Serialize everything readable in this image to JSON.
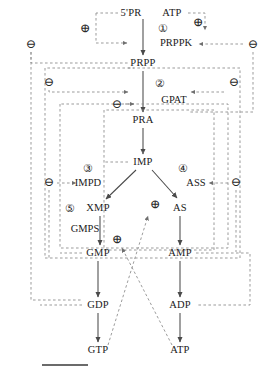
{
  "diagram": {
    "colors": {
      "reaction_arrow": "#4a4a4a",
      "regulation_line": "#8a8a8a",
      "text": "#1a1a1a",
      "background": "#ffffff"
    },
    "legend": {
      "solid_meaning": "reaction",
      "dashed_meaning": "feedback regulation",
      "plus_symbol": "⊕",
      "minus_symbol": "⊖",
      "plus_meaning": "activation",
      "minus_meaning": "inhibition"
    }
  },
  "metabolites": [
    {
      "id": "r5p",
      "label": "5'PR",
      "x": 131,
      "y": 13
    },
    {
      "id": "atp_t",
      "label": "ATP",
      "x": 172,
      "y": 13
    },
    {
      "id": "prpp",
      "label": "PRPP",
      "x": 143,
      "y": 63
    },
    {
      "id": "pra",
      "label": "PRA",
      "x": 143,
      "y": 120
    },
    {
      "id": "imp",
      "label": "IMP",
      "x": 143,
      "y": 162
    },
    {
      "id": "xmp",
      "label": "XMP",
      "x": 98,
      "y": 208
    },
    {
      "id": "as",
      "label": "AS",
      "x": 180,
      "y": 208
    },
    {
      "id": "gmp",
      "label": "GMP",
      "x": 98,
      "y": 253
    },
    {
      "id": "amp",
      "label": "AMP",
      "x": 180,
      "y": 253
    },
    {
      "id": "gdp",
      "label": "GDP",
      "x": 98,
      "y": 305
    },
    {
      "id": "adp",
      "label": "ADP",
      "x": 180,
      "y": 305
    },
    {
      "id": "gtp",
      "label": "GTP",
      "x": 98,
      "y": 350
    },
    {
      "id": "atp_b",
      "label": "ATP",
      "x": 180,
      "y": 350
    }
  ],
  "enzymes": [
    {
      "id": "prppk",
      "label": "PRPPK",
      "x": 176,
      "y": 43,
      "number": "①",
      "num_x": 163,
      "num_y": 28
    },
    {
      "id": "gpat",
      "label": "GPAT",
      "x": 174,
      "y": 100,
      "number": "②",
      "num_x": 160,
      "num_y": 83
    },
    {
      "id": "impd",
      "label": "IMPD",
      "x": 88,
      "y": 183,
      "number": "③",
      "num_x": 88,
      "num_y": 168
    },
    {
      "id": "ass",
      "label": "ASS",
      "x": 196,
      "y": 183,
      "number": "④",
      "num_x": 183,
      "num_y": 168
    },
    {
      "id": "gmps",
      "label": "GMPS",
      "x": 85,
      "y": 229,
      "number": "⑤",
      "num_x": 70,
      "num_y": 208
    }
  ],
  "regulators": [
    {
      "id": "plus-prppk-right",
      "symbol": "⊕",
      "x": 198,
      "y": 22
    },
    {
      "id": "plus-prpp-left",
      "symbol": "⊕",
      "x": 85,
      "y": 28
    },
    {
      "id": "minus-left-1",
      "symbol": "⊖",
      "x": 31,
      "y": 44
    },
    {
      "id": "minus-right-1",
      "symbol": "⊖",
      "x": 253,
      "y": 44
    },
    {
      "id": "minus-left-2",
      "symbol": "⊖",
      "x": 49,
      "y": 82
    },
    {
      "id": "minus-right-2",
      "symbol": "⊖",
      "x": 234,
      "y": 82
    },
    {
      "id": "minus-pra",
      "symbol": "⊖",
      "x": 117,
      "y": 104
    },
    {
      "id": "minus-impd",
      "symbol": "⊖",
      "x": 49,
      "y": 182
    },
    {
      "id": "minus-ass",
      "symbol": "⊖",
      "x": 236,
      "y": 182
    },
    {
      "id": "plus-as",
      "symbol": "⊕",
      "x": 155,
      "y": 204
    },
    {
      "id": "plus-gmp",
      "symbol": "⊕",
      "x": 117,
      "y": 239
    }
  ],
  "reactions": [
    {
      "from": "5'PR + ATP",
      "to": "PRPP",
      "enzyme": "PRPPK"
    },
    {
      "from": "PRPP",
      "to": "PRA",
      "enzyme": "GPAT"
    },
    {
      "from": "PRA",
      "to": "IMP",
      "enzyme": ""
    },
    {
      "from": "IMP",
      "to": "XMP",
      "enzyme": "IMPD"
    },
    {
      "from": "IMP",
      "to": "AS",
      "enzyme": "ASS"
    },
    {
      "from": "XMP",
      "to": "GMP",
      "enzyme": "GMPS"
    },
    {
      "from": "AS",
      "to": "AMP",
      "enzyme": ""
    },
    {
      "from": "GMP",
      "to": "GDP",
      "enzyme": ""
    },
    {
      "from": "AMP",
      "to": "ADP",
      "enzyme": ""
    },
    {
      "from": "GDP",
      "to": "GTP",
      "enzyme": ""
    },
    {
      "from": "ADP",
      "to": "ATP",
      "enzyme": ""
    }
  ]
}
